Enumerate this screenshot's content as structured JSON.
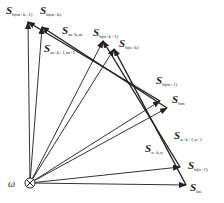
{
  "diagram": {
    "origin_label": "ω",
    "origin_symbol": "circle-cross",
    "vectors_from_origin": [
      {
        "name": "S",
        "sub": "b(m+k+1)"
      },
      {
        "name": "S",
        "sub": "b(m+k)"
      },
      {
        "name": "S",
        "sub": "b(n+k+1)"
      },
      {
        "name": "S",
        "sub": "b(n+k)"
      },
      {
        "name": "S",
        "sub": "b(m+1)"
      },
      {
        "name": "S",
        "sub": "bm"
      },
      {
        "name": "S",
        "sub": "b(n+1)"
      },
      {
        "name": "S",
        "sub": "bn"
      }
    ],
    "difference_vectors": [
      {
        "name": "S",
        "sub": "m+k,m"
      },
      {
        "name": "S",
        "sub": "m+k+1,m+1"
      },
      {
        "name": "S",
        "sub": "n+k+1,n+1"
      },
      {
        "name": "S",
        "sub": "n+k,n"
      }
    ],
    "colors": {
      "line": "#333333",
      "background": "#ffffff"
    }
  }
}
